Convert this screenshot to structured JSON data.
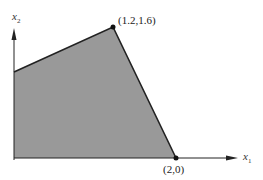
{
  "diagram": {
    "type": "feasible-region",
    "axes": {
      "x_label": "x",
      "x_subscript": "1",
      "y_label": "x",
      "y_subscript": "2"
    },
    "vertices": [
      {
        "label": "(1.2,1.6)",
        "x": 1.2,
        "y": 1.6
      },
      {
        "label": "(2,0)",
        "x": 2,
        "y": 0
      }
    ],
    "region_fill": "#999999",
    "edge_color": "#222222"
  }
}
